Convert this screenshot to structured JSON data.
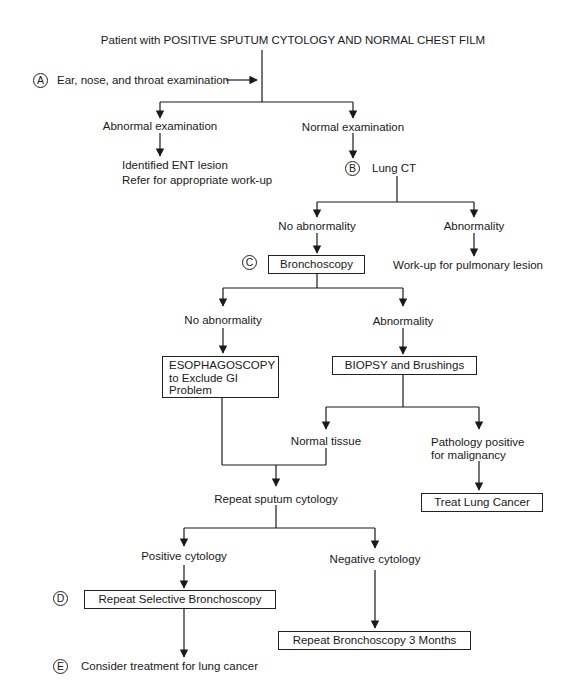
{
  "diagram": {
    "title": "Patient with POSITIVE SPUTUM CYTOLOGY AND NORMAL CHEST FILM",
    "step_labels": {
      "a": "A",
      "b": "B",
      "c": "C",
      "d": "D",
      "e": "E"
    },
    "ent_exam": "Ear, nose, and throat examination",
    "abnormal_exam": "Abnormal examination",
    "ent_lesion_line1": "Identified ENT lesion",
    "ent_lesion_line2": "Refer for appropriate work-up",
    "normal_exam": "Normal examination",
    "lung_ct": "Lung CT",
    "ct_no_abnormality": "No abnormality",
    "ct_abnormality": "Abnormality",
    "pulmonary_workup": "Work-up for pulmonary lesion",
    "bronchoscopy": "Bronchoscopy",
    "bronch_no_abnormality": "No abnormality",
    "bronch_abnormality": "Abnormality",
    "esophagoscopy_line1": "ESOPHAGOSCOPY",
    "esophagoscopy_line2": "to Exclude GI",
    "esophagoscopy_line3": "Problem",
    "biopsy": "BIOPSY and Brushings",
    "normal_tissue": "Normal tissue",
    "pathology_line1": "Pathology positive",
    "pathology_line2": "for malignancy",
    "treat_lung_cancer": "Treat Lung Cancer",
    "repeat_sputum": "Repeat sputum cytology",
    "positive_cytology": "Positive cytology",
    "negative_cytology": "Negative cytology",
    "repeat_selective_bronch": "Repeat Selective Bronchoscopy",
    "repeat_bronch_3mo": "Repeat Bronchoscopy 3 Months",
    "consider_treatment": "Consider treatment for lung cancer"
  }
}
